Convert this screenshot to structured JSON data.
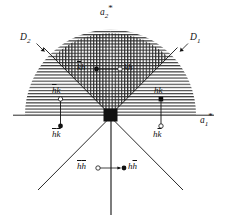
{
  "figure": {
    "background": "#ffffff",
    "ink": "#111111",
    "width": 230,
    "height": 219
  },
  "axes": {
    "a2_star": {
      "label": "a",
      "sub": "2",
      "star": "*"
    },
    "a1_star": {
      "label": "a",
      "sub": "1",
      "star": "*"
    }
  },
  "boundaries": {
    "d2": {
      "label": "D",
      "sub": "2"
    },
    "d1": {
      "label": "D",
      "sub": "1"
    }
  },
  "origin": {
    "name": "origin-marker",
    "shape": "filled-square"
  },
  "reflections": [
    {
      "id": "khbar",
      "text": "kh",
      "overline_first": true,
      "marker": "filled",
      "pair": "upper"
    },
    {
      "id": "kh",
      "text": "kh",
      "overline_first": false,
      "marker": "open",
      "pair": "upper"
    },
    {
      "id": "hbark",
      "text": "hk",
      "overline_first": true,
      "marker": "open",
      "pair": "left"
    },
    {
      "id": "hbarkbar",
      "text": "hk",
      "overline_both": true,
      "marker": "filled",
      "pair": "left"
    },
    {
      "id": "hk",
      "text": "hk",
      "overline_first": false,
      "marker": "filled",
      "pair": "right"
    },
    {
      "id": "hkbar",
      "text": "hk",
      "overline_second": true,
      "marker": "open",
      "pair": "right"
    },
    {
      "id": "hbarhbar",
      "text": "hh",
      "overline_both": true,
      "marker": "open",
      "pair": "lower"
    },
    {
      "id": "hhbar",
      "text": "hh",
      "overline_second": true,
      "marker": "filled",
      "pair": "lower"
    }
  ],
  "hatching": {
    "center_sector": "vertical-lines",
    "outer_sectors": "horizontal-lines"
  }
}
